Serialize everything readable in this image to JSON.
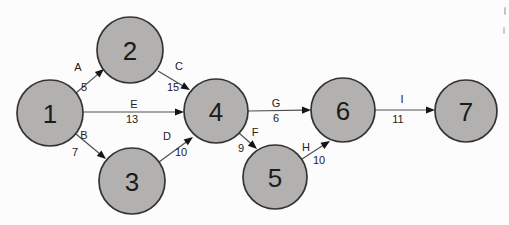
{
  "canvas": {
    "width": 509,
    "height": 225,
    "background": "#fcfcfc"
  },
  "diagram": {
    "type": "activity-network",
    "node_style": {
      "fill": "#b3b1af",
      "stroke": "#333333",
      "stroke_width": 1.7,
      "font_size": 26,
      "text_color": "#1b1b1b"
    },
    "edge_style": {
      "line_color": "#4f4f4f",
      "line_width": 1.2,
      "arrow_color": "#151515",
      "arrow_length": 9,
      "arrow_half_width": 3.6,
      "label_font_size": 11,
      "label_color": "#222222"
    },
    "nodes": [
      {
        "id": "1",
        "x": 50,
        "y": 113,
        "r": 33
      },
      {
        "id": "2",
        "x": 130,
        "y": 50,
        "r": 33
      },
      {
        "id": "3",
        "x": 132,
        "y": 181,
        "r": 33
      },
      {
        "id": "4",
        "x": 216,
        "y": 111,
        "r": 32
      },
      {
        "id": "5",
        "x": 275,
        "y": 177,
        "r": 32
      },
      {
        "id": "6",
        "x": 343,
        "y": 110,
        "r": 32
      },
      {
        "id": "7",
        "x": 466,
        "y": 111,
        "r": 31
      }
    ],
    "edges": [
      {
        "from": "1",
        "to": "2",
        "label": "A",
        "value": "5",
        "x1": 76,
        "y1": 93,
        "x2": 104,
        "y2": 69,
        "label_x": 78,
        "label_y": 71,
        "value_x": 84,
        "value_y": 91
      },
      {
        "from": "2",
        "to": "4",
        "label": "C",
        "value": "15",
        "x1": 158,
        "y1": 71,
        "x2": 190,
        "y2": 90,
        "label_x": 179,
        "label_y": 70,
        "value_x": 173,
        "value_y": 91
      },
      {
        "from": "1",
        "to": "4",
        "label": "E",
        "value": "13",
        "x1": 83,
        "y1": 112,
        "x2": 184,
        "y2": 112,
        "label_x": 134,
        "label_y": 108,
        "value_x": 132,
        "value_y": 123
      },
      {
        "from": "1",
        "to": "3",
        "label": "B",
        "value": "7",
        "x1": 76,
        "y1": 134,
        "x2": 106,
        "y2": 159,
        "label_x": 84,
        "label_y": 139,
        "value_x": 75,
        "value_y": 156
      },
      {
        "from": "3",
        "to": "4",
        "label": "D",
        "value": "10",
        "x1": 159,
        "y1": 162,
        "x2": 193,
        "y2": 137,
        "label_x": 167,
        "label_y": 140,
        "value_x": 181,
        "value_y": 156
      },
      {
        "from": "4",
        "to": "6",
        "label": "G",
        "value": "6",
        "x1": 248,
        "y1": 111,
        "x2": 311,
        "y2": 110,
        "label_x": 276,
        "label_y": 107,
        "value_x": 276,
        "value_y": 122
      },
      {
        "from": "4",
        "to": "5",
        "label": "F",
        "value": "9",
        "x1": 239,
        "y1": 133,
        "x2": 257,
        "y2": 149,
        "label_x": 255,
        "label_y": 136,
        "value_x": 241,
        "value_y": 152
      },
      {
        "from": "5",
        "to": "6",
        "label": "H",
        "value": "10",
        "x1": 302,
        "y1": 159,
        "x2": 330,
        "y2": 141,
        "label_x": 306,
        "label_y": 151,
        "value_x": 319,
        "value_y": 164
      },
      {
        "from": "6",
        "to": "7",
        "label": "I",
        "value": "11",
        "x1": 375,
        "y1": 110,
        "x2": 435,
        "y2": 110,
        "label_x": 402,
        "label_y": 103,
        "value_x": 398,
        "value_y": 123
      }
    ],
    "artifacts": [
      {
        "x": 504,
        "y": 7,
        "w": 2,
        "h": 8,
        "color": "#c6c6c6"
      },
      {
        "x": 503,
        "y": 27,
        "w": 2,
        "h": 7,
        "color": "#cccccc"
      }
    ]
  }
}
